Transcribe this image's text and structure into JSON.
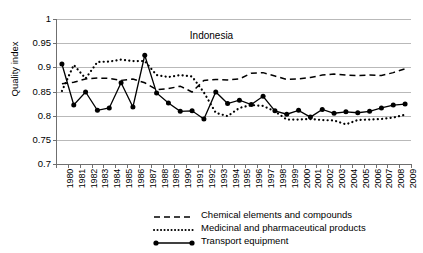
{
  "chart_data": {
    "type": "line",
    "title": "Indonesia",
    "xlabel": "",
    "ylabel": "Quality index",
    "ylim": [
      0.7,
      1.0
    ],
    "yticks": [
      "1",
      "0.95",
      "0.9",
      "0.85",
      "0.8",
      "0.75",
      "0.7"
    ],
    "ytick_values": [
      1,
      0.95,
      0.9,
      0.85,
      0.8,
      0.75,
      0.7
    ],
    "grid": "horizontal",
    "legend_position": "bottom",
    "categories": [
      "1980",
      "1981",
      "1982",
      "1983",
      "1984",
      "1985",
      "1986",
      "1987",
      "1988",
      "1989",
      "1990",
      "1991",
      "1992",
      "1993",
      "1994",
      "1995",
      "1996",
      "1997",
      "1998",
      "1999",
      "2000",
      "2001",
      "2002",
      "2003",
      "2004",
      "2005",
      "2006",
      "2007",
      "2008",
      "2009"
    ],
    "series": [
      {
        "name": "Chemical elements and compounds",
        "style": "dashed",
        "values": [
          0.866,
          0.869,
          0.876,
          0.878,
          0.877,
          0.873,
          0.876,
          0.868,
          0.854,
          0.856,
          0.861,
          0.849,
          0.873,
          0.875,
          0.874,
          0.876,
          0.888,
          0.889,
          0.882,
          0.875,
          0.876,
          0.879,
          0.884,
          0.886,
          0.884,
          0.883,
          0.884,
          0.883,
          0.889,
          0.897
        ]
      },
      {
        "name": "Medicinal and pharmaceutical products",
        "style": "dotted",
        "values": [
          0.851,
          0.905,
          0.877,
          0.911,
          0.912,
          0.916,
          0.913,
          0.913,
          0.884,
          0.88,
          0.884,
          0.881,
          0.848,
          0.806,
          0.799,
          0.816,
          0.822,
          0.82,
          0.809,
          0.792,
          0.792,
          0.793,
          0.791,
          0.79,
          0.782,
          0.791,
          0.792,
          0.793,
          0.796,
          0.802
        ]
      },
      {
        "name": "Transport equipment",
        "style": "solid-marker",
        "values": [
          0.907,
          0.822,
          0.849,
          0.811,
          0.816,
          0.868,
          0.818,
          0.925,
          0.847,
          0.826,
          0.809,
          0.81,
          0.793,
          0.849,
          0.825,
          0.832,
          0.823,
          0.84,
          0.81,
          0.803,
          0.811,
          0.797,
          0.813,
          0.805,
          0.808,
          0.806,
          0.809,
          0.816,
          0.822,
          0.824
        ]
      }
    ]
  },
  "legend": [
    {
      "label": "Chemical elements and compounds",
      "style": "dashed"
    },
    {
      "label": "Medicinal and pharmaceutical products",
      "style": "dotted"
    },
    {
      "label": "Transport equipment",
      "style": "solid-marker"
    }
  ]
}
